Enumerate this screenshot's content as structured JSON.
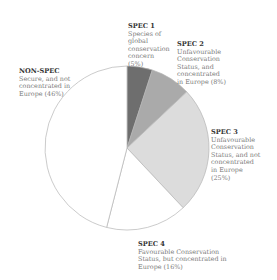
{
  "chart_data": {
    "type": "pie",
    "title": "",
    "start_angle_deg": 0,
    "direction": "clockwise",
    "categories": [
      "SPEC 1",
      "SPEC 2",
      "SPEC 3",
      "SPEC 4",
      "NON-SPEC"
    ],
    "values": [
      5,
      8,
      25,
      16,
      46
    ],
    "colors": [
      "#6e6e6e",
      "#aaaaaa",
      "#dcdcdc",
      "#ffffff",
      "#ffffff"
    ],
    "stroke": "#b5b5b5",
    "slices": [
      {
        "name": "SPEC 1",
        "desc": "Species of global conservation concern (5%)",
        "value": 5
      },
      {
        "name": "SPEC 2",
        "desc": "Unfavourable Conservation Status, and concentrated in Europe (8%)",
        "value": 8
      },
      {
        "name": "SPEC 3",
        "desc": "Unfavourable Conservation Status, and not concentrated in Europe (25%)",
        "value": 25
      },
      {
        "name": "SPEC 4",
        "desc": "Favourable Conservation Status, but concentrated in Europe (16%)",
        "value": 16
      },
      {
        "name": "NON-SPEC",
        "desc": "Secure, and not concentrated in Europe (46%)",
        "value": 46
      }
    ]
  },
  "labels": {
    "spec1": {
      "title": "SPEC 1",
      "lines": [
        "Species of",
        "global",
        "conservation",
        "concern",
        "(5%)"
      ]
    },
    "spec2": {
      "title": "SPEC 2",
      "lines": [
        "Unfavourable",
        "Conservation",
        "Status, and",
        "concentrated",
        "in Europe (8%)"
      ]
    },
    "spec3": {
      "title": "SPEC 3",
      "lines": [
        "Unfavourable",
        "Conservation",
        "Status, and not",
        "concentrated",
        "in Europe",
        "(25%)"
      ]
    },
    "spec4": {
      "title": "SPEC 4",
      "lines": [
        "Favourable Conservation",
        "Status, but concentrated in",
        "Europe (16%)"
      ]
    },
    "nonspec": {
      "title": "NON-SPEC",
      "lines": [
        "Secure, and not",
        "concentrated in",
        "Europe (46%)"
      ]
    }
  }
}
